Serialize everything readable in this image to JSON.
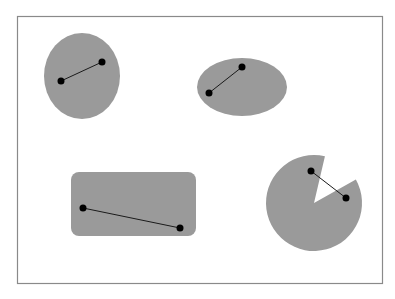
{
  "frame": {
    "x": 17,
    "y": 16,
    "width": 365,
    "height": 267,
    "stroke": "#8a8a8a",
    "fill": "#ffffff"
  },
  "colors": {
    "shape_fill": "#9a9a9a",
    "line": "#1a1a1a",
    "dot": "#000000"
  },
  "shapes": [
    {
      "type": "ellipse",
      "name": "ellipse-tall",
      "cx": 82,
      "cy": 76,
      "rx": 38,
      "ry": 43,
      "segment": {
        "p1": [
          61,
          81
        ],
        "p2": [
          102,
          62
        ]
      }
    },
    {
      "type": "ellipse",
      "name": "ellipse-wide",
      "cx": 242,
      "cy": 87,
      "rx": 45,
      "ry": 29,
      "segment": {
        "p1": [
          209,
          93
        ],
        "p2": [
          242,
          67
        ]
      }
    },
    {
      "type": "rounded-rect",
      "name": "rounded-rectangle",
      "x": 71,
      "y": 172,
      "width": 125,
      "height": 64,
      "r": 8,
      "segment": {
        "p1": [
          83,
          208
        ],
        "p2": [
          180,
          228
        ]
      }
    },
    {
      "type": "pacman",
      "name": "pacman-circle",
      "cx": 314,
      "cy": 203,
      "r": 48,
      "wedge": {
        "start": [
          325,
          156
        ],
        "end": [
          355,
          180
        ]
      },
      "segment": {
        "p1": [
          311,
          171
        ],
        "p2": [
          346,
          198
        ]
      }
    }
  ],
  "dot_radius": 3.5
}
